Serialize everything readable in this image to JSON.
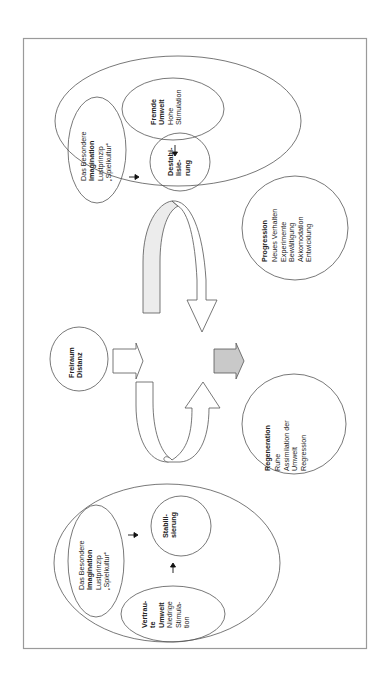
{
  "diagram": {
    "orientation": "rotated -90deg (text reads bottom-to-top)",
    "colors": {
      "frame": "#9a9a9a",
      "outline": "#555555",
      "gray_arrow_fill": "#c9c9c9",
      "light_arrow_fill": "#ececec"
    },
    "top_group": {
      "besondere": {
        "line1": "Das Besondere",
        "line2": "Imagination",
        "line3": "Lustprinzip",
        "line4": "„Spielkultur“"
      },
      "fremde": {
        "line1": "Fremde",
        "line2": "Umwelt",
        "line3": "Hohe",
        "line4": "Stimulation"
      },
      "destab": {
        "line1": "Destabi-",
        "line2": "lisie-",
        "line3": "rung"
      }
    },
    "freiraum": {
      "line1": "Freiraum",
      "line2": "Distanz"
    },
    "progression": {
      "title": "Progression",
      "items": [
        "Neues Verhalten",
        "Experimente",
        "Bewältigung",
        "Akkomodation",
        "Entwicklung"
      ]
    },
    "regeneration": {
      "title": "Regeneration",
      "items": [
        "Ruhe",
        "Assimilation der",
        "Umwelt",
        "Regression"
      ]
    },
    "bottom_group": {
      "besondere": {
        "line1": "Das Besondere",
        "line2": "Imagination",
        "line3": "Lustprinzip",
        "line4": "„Spielkultur“"
      },
      "stabil": {
        "line1": "Stabili-",
        "line2": "sierung"
      },
      "vertraute": {
        "line1": "Vertrau-",
        "line2": "te",
        "line3": "Umwelt",
        "line4": "Niedrige",
        "line5": "Stimula-",
        "line6": "tion"
      }
    }
  }
}
